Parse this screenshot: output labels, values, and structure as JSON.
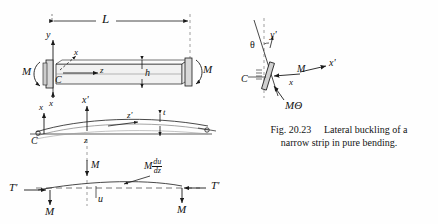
{
  "figure": {
    "caption_number": "Fig. 20.23",
    "caption_text_line1": "Lateral buckling of a",
    "caption_text_line2": "narrow strip in pure bending.",
    "ink_color": "#1a1a1a",
    "background_color": "#fefefe"
  },
  "diagram_top": {
    "name": "undeformed-strip-pure-bending",
    "labels": {
      "length": "L",
      "axis_y": "y",
      "axis_x_upper": "x",
      "axis_z": "z",
      "axis_x_lower": "x",
      "origin": "C",
      "depth": "h",
      "moment_left": "M",
      "moment_right": "M"
    }
  },
  "diagram_middle": {
    "name": "buckled-strip-side-view",
    "labels": {
      "axis_x": "x",
      "axis_x_prime": "x'",
      "axis_z": "z",
      "axis_z_prime": "z'",
      "thickness": "t",
      "origin": "C"
    }
  },
  "diagram_bottom": {
    "name": "buckled-strip-plan-view-forces",
    "labels": {
      "force_left": "T'",
      "force_right": "T'",
      "moment_left": "M",
      "moment_center": "M",
      "moment_right": "M",
      "torque_numerator": "du",
      "torque_denominator": "dz",
      "torque_prefix": "M",
      "deflection": "u"
    }
  },
  "diagram_right": {
    "name": "rotated-cross-section-detail",
    "labels": {
      "angle": "θ",
      "axis_y_prime": "y'",
      "axis_x": "x",
      "axis_x_prime": "x'",
      "moment": "M",
      "moment_theta": "MΘ",
      "origin": "C"
    }
  }
}
